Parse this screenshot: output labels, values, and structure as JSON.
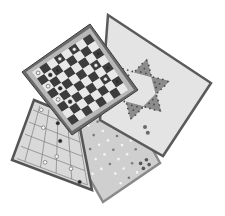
{
  "image": {
    "description": "Grayscale product photo of four stacked game boards",
    "background": "#ffffff"
  },
  "boards": [
    {
      "name": "ludo-board",
      "label": "Pachisi / cross-and-circle board",
      "corners": [
        [
          62,
          130
        ],
        [
          128,
          104
        ],
        [
          160,
          163
        ],
        [
          103,
          202
        ]
      ],
      "fill": "#cfcfcf",
      "border": "#8a8a8a"
    },
    {
      "name": "morris-board",
      "label": "Nine men's morris / halma lines board",
      "corners": [
        [
          34,
          100
        ],
        [
          80,
          120
        ],
        [
          92,
          190
        ],
        [
          12,
          160
        ]
      ],
      "fill": "#d9d9d9",
      "border": "#555555"
    },
    {
      "name": "chinese-checkers-board",
      "label": "Chinese checkers board",
      "corners": [
        [
          108,
          15
        ],
        [
          211,
          83
        ],
        [
          163,
          156
        ],
        [
          100,
          120
        ]
      ],
      "fill": "#e4e4e4",
      "border": "#5a5a5a",
      "star_fill": "#8c8c8c"
    },
    {
      "name": "checkers-board",
      "label": "Checkers board",
      "corners": [
        [
          90,
          24
        ],
        [
          138,
          90
        ],
        [
          72,
          135
        ],
        [
          22,
          72
        ]
      ],
      "frame": "#6a6a6a",
      "inner_frame": "#b8b8b8",
      "dark_square": "#3c3c3c",
      "light_square": "#e8e8e8",
      "grid": 8
    }
  ]
}
